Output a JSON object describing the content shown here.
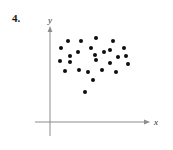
{
  "figure": {
    "exercise_number": "4.",
    "axis_color": "#8c8c8c",
    "dot_color": "#0d0d0d",
    "background_color": "#ffffff"
  },
  "axes": {
    "x_label": "x",
    "y_label": "y",
    "x_axis": {
      "y_px": 122,
      "x_start_px": 35,
      "x_end_px": 148,
      "arrow": "right"
    },
    "y_axis": {
      "x_px": 50,
      "y_start_px": 27,
      "y_end_px": 136,
      "arrow": "up"
    }
  },
  "chart_data": {
    "type": "scatter",
    "title": "4.",
    "xlabel": "x",
    "ylabel": "y",
    "grid": false,
    "legend": null,
    "axis_ticks": {
      "x": [],
      "y": []
    },
    "origin_px": {
      "x": 50,
      "y": 122
    },
    "point_count": 26,
    "note": "Unlabeled scatter plot with no tick values; points given in pixel coordinates of the figure.",
    "points_px": [
      {
        "x": 61,
        "y": 48
      },
      {
        "x": 68,
        "y": 41
      },
      {
        "x": 70,
        "y": 56
      },
      {
        "x": 60,
        "y": 61
      },
      {
        "x": 70,
        "y": 62
      },
      {
        "x": 65,
        "y": 71
      },
      {
        "x": 81,
        "y": 41
      },
      {
        "x": 78,
        "y": 52
      },
      {
        "x": 79,
        "y": 70
      },
      {
        "x": 85,
        "y": 92
      },
      {
        "x": 88,
        "y": 72
      },
      {
        "x": 93,
        "y": 80
      },
      {
        "x": 91,
        "y": 48
      },
      {
        "x": 96,
        "y": 38
      },
      {
        "x": 96,
        "y": 60
      },
      {
        "x": 95,
        "y": 55
      },
      {
        "x": 104,
        "y": 52
      },
      {
        "x": 102,
        "y": 70
      },
      {
        "x": 110,
        "y": 63
      },
      {
        "x": 113,
        "y": 41
      },
      {
        "x": 110,
        "y": 50
      },
      {
        "x": 116,
        "y": 72
      },
      {
        "x": 124,
        "y": 48
      },
      {
        "x": 126,
        "y": 56
      },
      {
        "x": 128,
        "y": 64
      },
      {
        "x": 118,
        "y": 57
      }
    ]
  }
}
